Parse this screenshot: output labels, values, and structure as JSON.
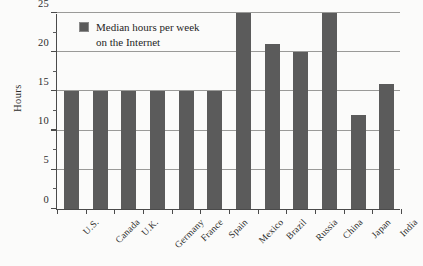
{
  "chart_data": {
    "type": "bar",
    "title": "",
    "xlabel": "",
    "ylabel": "Hours",
    "categories": [
      "U.S.",
      "Canada",
      "U.K.",
      "Germany",
      "France",
      "Spain",
      "Mexico",
      "Brazil",
      "Russia",
      "China",
      "Japan",
      "India"
    ],
    "values": [
      15,
      15,
      15,
      15,
      15,
      15,
      25,
      21,
      20,
      25,
      12,
      16
    ],
    "series": [
      {
        "name": "Median hours per week on the Internet",
        "values": [
          15,
          15,
          15,
          15,
          15,
          15,
          25,
          21,
          20,
          25,
          12,
          16
        ]
      }
    ],
    "ylim": [
      0,
      25
    ],
    "ytick_labels": [
      "0",
      "5",
      "10",
      "15",
      "20",
      "25"
    ],
    "ytick_values": [
      0,
      5,
      10,
      15,
      20,
      25
    ],
    "yminor_values": [
      2.5,
      7.5,
      12.5,
      17.5,
      22.5
    ],
    "grid": "horizontal",
    "legend_position": "top-left",
    "legend": [
      "Median hours per week on the Internet"
    ],
    "bar_color": "#5b5b5b",
    "gridline_color": "#9a9a98",
    "axis_color": "#4a4a4a",
    "background_color": "#fbfbfa"
  },
  "legend": {
    "line1": "Median hours per week",
    "line2": "on the Internet"
  }
}
